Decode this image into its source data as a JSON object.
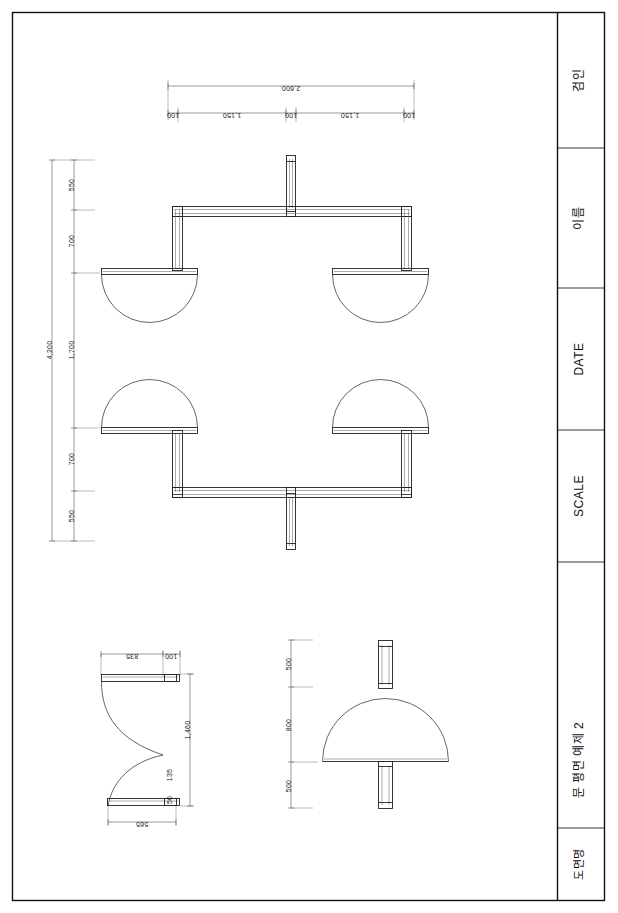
{
  "sheet": {
    "title": "문 평면 예제 2",
    "background": "#ffffff",
    "ink": "#1a1a1a",
    "border_outer": "#111111",
    "width": 618,
    "height": 913
  },
  "title_block": {
    "name": "title-block",
    "rows": [
      {
        "key": "approval",
        "label": "검인"
      },
      {
        "key": "name",
        "label": "이름"
      },
      {
        "key": "date",
        "label": "DATE"
      },
      {
        "key": "scale",
        "label": "SCALE"
      },
      {
        "key": "drawing",
        "label": "문 평면 예제 2"
      },
      {
        "key": "drawing_name_header",
        "label": "도면명"
      }
    ]
  },
  "views": {
    "plan": {
      "name": "main-plan-view",
      "top_dimension": {
        "total": "2,600",
        "segments": [
          "100",
          "1,150",
          "100",
          "1,150",
          "100"
        ]
      },
      "left_dimension": {
        "total": "4,200",
        "segments": [
          "550",
          "700",
          "1,700",
          "700",
          "550"
        ]
      }
    },
    "section_detail": {
      "name": "door-section-detail",
      "top_dimensions": [
        "835",
        "100"
      ],
      "right_dimension": "1,460",
      "inner_dimensions": [
        "135",
        "50"
      ],
      "bottom_dimension": "565"
    },
    "elevation": {
      "name": "door-elevation-view",
      "left_dimensions": [
        "500",
        "800",
        "500"
      ]
    }
  }
}
